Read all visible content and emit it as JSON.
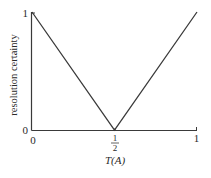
{
  "chart_data": {
    "type": "line",
    "title": "",
    "xlabel": "T(A)",
    "ylabel": "resolution certainty",
    "xlim": [
      0,
      1
    ],
    "ylim": [
      0,
      1
    ],
    "grid": false,
    "legend": null,
    "x_ticks": [
      {
        "value": 0,
        "label": "0"
      },
      {
        "value": 0.5,
        "label": "1/2",
        "numerator": "1",
        "denominator": "2"
      },
      {
        "value": 1,
        "label": "1"
      }
    ],
    "y_ticks": [
      {
        "value": 0,
        "label": "0"
      },
      {
        "value": 1,
        "label": "1"
      }
    ],
    "series": [
      {
        "name": "resolution certainty",
        "x": [
          0,
          0.5,
          1
        ],
        "y": [
          1,
          0,
          1
        ],
        "color": "#3a3a3a"
      }
    ]
  },
  "labels": {
    "xlabel": "T(A)",
    "ylabel": "resolution certainty",
    "y_tick_1": "1",
    "y_tick_0": "0",
    "x_tick_0": "0",
    "x_tick_half_num": "1",
    "x_tick_half_den": "2",
    "x_tick_1": "1"
  },
  "colors": {
    "line": "#3a3a3a",
    "axis": "#3a3a3a",
    "text": "#2a2a2a"
  }
}
